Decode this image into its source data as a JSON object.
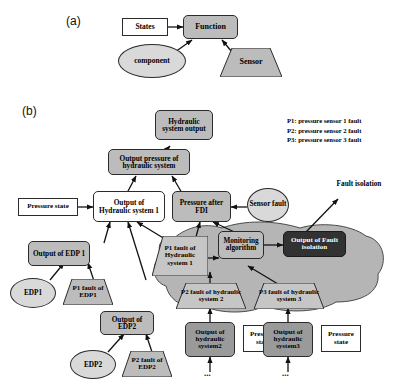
{
  "figure": {
    "panel_a_label": "(a)",
    "panel_b_label": "(b)"
  },
  "panel_a": {
    "states": "States",
    "function": "Function",
    "component": "component",
    "sensor": "Sensor"
  },
  "panel_b": {
    "hydraulic_system_output": "Hydraulic system output",
    "output_pressure": "Output pressure of hydraulic system",
    "pressure_state_1": "Pressure state",
    "output_hydraulic_1": "Output of Hydraulic system 1",
    "pressure_after_fdi": "Pressure after FDI",
    "sensor_fault": "Sensor fault",
    "fault_isolation_label": "Fault isolation",
    "output_edp1": "Output of EDP 1",
    "edp1": "EDP1",
    "p1_fault_edp1": "P1 fault of EDP1",
    "output_edp2": "Output of EDP2",
    "edp2": "EDP2",
    "p2_fault_edp2": "P2 fault of EDP2",
    "p1_fault_hyd1": "P1 fault of Hydraulic system 1",
    "monitoring_algorithm": "Monitoring algorithm",
    "output_fault_isolation": "Output of Fault isolation",
    "p2_fault_hyd2": "P2 fault of hydraulic system 2",
    "p3_fault_hyd3": "P3 fault of hydraulic system 3",
    "output_hydraulic_2": "Output of hydraulic system2",
    "output_hydraulic_3": "Output of hydraulic system3",
    "pressure_state_2": "Pressure state",
    "pressure_state_3": "Pressure state",
    "ellipsis_2": "...",
    "ellipsis_3": "..."
  },
  "legend": {
    "line1": "P1: pressure sensor 1 fault",
    "line2": "P2: pressure sensor 2 fault",
    "line3": "P3: pressure sensor 3 fault"
  },
  "colors": {
    "gray_fill": "#bcbcbc",
    "gray_fill_dark": "#9a9a9a",
    "dark_fill": "#323232",
    "blob_fill": "#b5b5b5",
    "outline": "#2b2b2b"
  }
}
